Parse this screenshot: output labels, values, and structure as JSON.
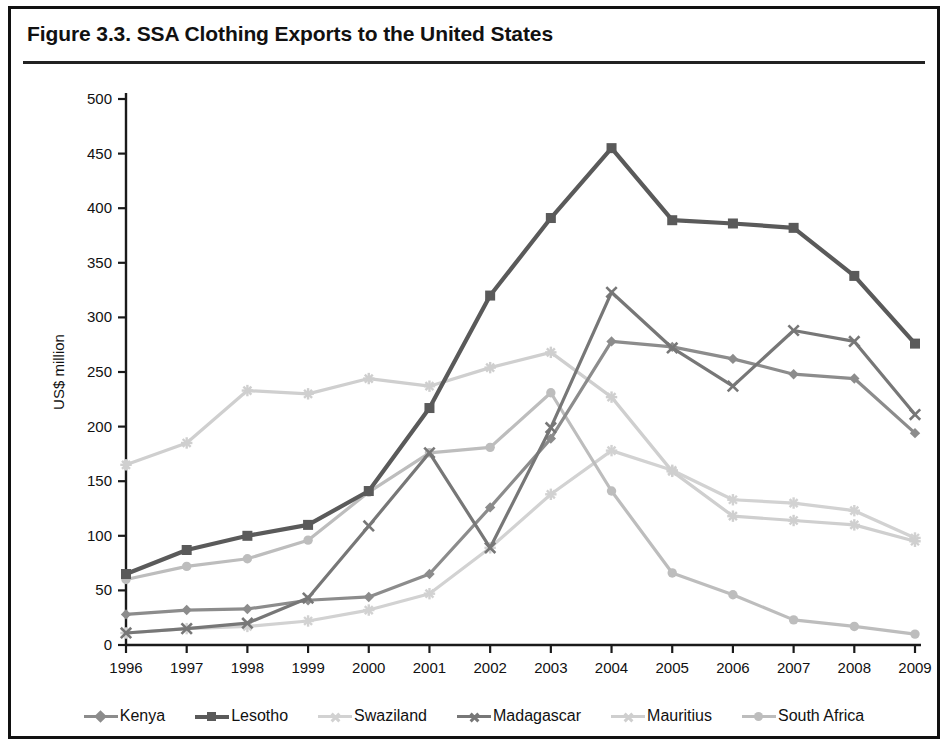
{
  "figure": {
    "title": "Figure 3.3. SSA Clothing Exports to the United States"
  },
  "chart_data": {
    "type": "line",
    "title": "Figure 3.3. SSA Clothing Exports to the United States",
    "xlabel": "",
    "ylabel": "US$ million",
    "x": [
      1996,
      1997,
      1998,
      1999,
      2000,
      2001,
      2002,
      2003,
      2004,
      2005,
      2006,
      2007,
      2008,
      2009
    ],
    "categories": [
      "1996",
      "1997",
      "1998",
      "1999",
      "2000",
      "2001",
      "2002",
      "2003",
      "2004",
      "2005",
      "2006",
      "2007",
      "2008",
      "2009"
    ],
    "ylim": [
      0,
      500
    ],
    "yticks": [
      0,
      50,
      100,
      150,
      200,
      250,
      300,
      350,
      400,
      450,
      500
    ],
    "grid": false,
    "legend_position": "bottom",
    "series": [
      {
        "name": "Kenya",
        "color": "#8c8c8c",
        "marker": "diamond",
        "values": [
          28,
          32,
          33,
          41,
          44,
          65,
          126,
          189,
          278,
          273,
          262,
          248,
          244,
          194
        ]
      },
      {
        "name": "Lesotho",
        "color": "#5a5a5a",
        "marker": "square",
        "values": [
          65,
          87,
          100,
          110,
          141,
          217,
          320,
          391,
          455,
          389,
          386,
          382,
          338,
          276
        ]
      },
      {
        "name": "Swaziland",
        "color": "#d2d2d2",
        "marker": "star",
        "values": [
          11,
          15,
          17,
          22,
          32,
          47,
          89,
          138,
          178,
          160,
          133,
          130,
          123,
          98
        ]
      },
      {
        "name": "Madagascar",
        "color": "#777777",
        "marker": "x",
        "values": [
          11,
          15,
          20,
          43,
          109,
          176,
          89,
          199,
          323,
          272,
          237,
          288,
          278,
          211
        ]
      },
      {
        "name": "Mauritius",
        "color": "#cfcfcf",
        "marker": "star",
        "values": [
          165,
          185,
          233,
          230,
          244,
          237,
          254,
          268,
          227,
          159,
          118,
          114,
          110,
          95
        ]
      },
      {
        "name": "South Africa",
        "color": "#bdbdbd",
        "marker": "circle",
        "values": [
          60,
          72,
          79,
          96,
          140,
          176,
          181,
          231,
          141,
          66,
          46,
          23,
          17,
          10
        ]
      }
    ]
  },
  "axis": {
    "y_label": "US$ million",
    "y_ticks": [
      "0",
      "50",
      "100",
      "150",
      "200",
      "250",
      "300",
      "350",
      "400",
      "450",
      "500"
    ],
    "x_ticks": [
      "1996",
      "1997",
      "1998",
      "1999",
      "2000",
      "2001",
      "2002",
      "2003",
      "2004",
      "2005",
      "2006",
      "2007",
      "2008",
      "2009"
    ]
  },
  "legend": {
    "items": [
      {
        "label": "Kenya"
      },
      {
        "label": "Lesotho"
      },
      {
        "label": "Swaziland"
      },
      {
        "label": "Madagascar"
      },
      {
        "label": "Mauritius"
      },
      {
        "label": "South Africa"
      }
    ]
  }
}
